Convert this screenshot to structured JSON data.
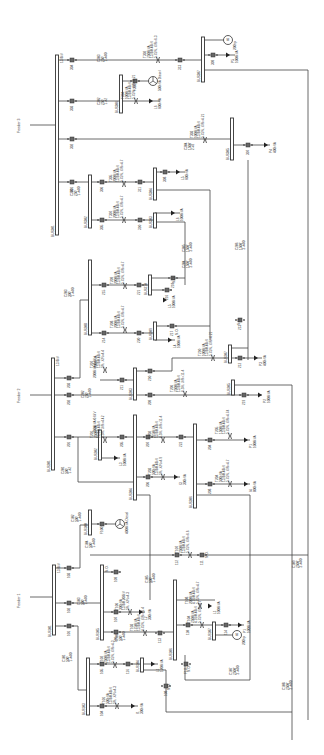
{
  "diagram": {
    "orientation": "rotated -90deg (text reads bottom-to-top)",
    "feeders": [
      {
        "name": "Feeder 3",
        "voltage": "13.8kV",
        "main_bus": "BUS301",
        "label_pos": [
          20,
          125
        ],
        "bus_x": 57,
        "bus_y": [
          55,
          235
        ]
      },
      {
        "name": "Feeder 2",
        "voltage": "13.8kV",
        "main_bus": "BUS201",
        "label_pos": [
          20,
          395
        ],
        "bus_x": 53,
        "bus_y": [
          358,
          470
        ]
      },
      {
        "name": "Feeder 1",
        "voltage": "13.8kV",
        "main_bus": "BUS101",
        "label_pos": [
          20,
          600
        ],
        "bus_x": 54,
        "bus_y": [
          565,
          635
        ]
      }
    ],
    "buses": [
      {
        "id": "BUS307",
        "x": 203,
        "y": [
          37,
          82
        ]
      },
      {
        "id": "BUS306",
        "x": 121,
        "y": [
          75,
          113
        ]
      },
      {
        "id": "BUS305",
        "x": 232,
        "y": [
          118,
          160
        ]
      },
      {
        "id": "BUS302",
        "x": 90,
        "y": [
          175,
          228
        ]
      },
      {
        "id": "BUS304",
        "x": 155,
        "y": [
          168,
          200
        ]
      },
      {
        "id": "BUS303",
        "x": 155,
        "y": [
          213,
          228
        ]
      },
      {
        "id": "BUS208",
        "x": 90,
        "y": [
          260,
          335
        ]
      },
      {
        "id": "BUS210",
        "x": 150,
        "y": [
          275,
          295
        ]
      },
      {
        "id": "BUS209",
        "x": 155,
        "y": [
          322,
          340
        ]
      },
      {
        "id": "BUS207",
        "x": 230,
        "y": [
          345,
          363
        ]
      },
      {
        "id": "BUS203",
        "x": 135,
        "y": [
          368,
          400
        ]
      },
      {
        "id": "BUS202",
        "x": 100,
        "y": [
          430,
          460
        ]
      },
      {
        "id": "BUS205",
        "x": 233,
        "y": [
          380,
          395
        ]
      },
      {
        "id": "BUS204",
        "x": 135,
        "y": [
          415,
          500
        ]
      },
      {
        "id": "BUS206",
        "x": 195,
        "y": [
          424,
          508
        ]
      },
      {
        "id": "BUS100",
        "x": 90,
        "y": [
          510,
          535
        ]
      },
      {
        "id": "BUS105",
        "x": 102,
        "y": [
          565,
          640
        ]
      },
      {
        "id": "BUS106",
        "x": 175,
        "y": [
          580,
          660
        ]
      },
      {
        "id": "BUS107",
        "x": 214,
        "y": [
          622,
          640
        ]
      },
      {
        "id": "BUS103",
        "x": 88,
        "y": [
          658,
          715
        ]
      },
      {
        "id": "BUS104",
        "x": 142,
        "y": [
          658,
          672
        ]
      }
    ],
    "transformers": [
      {
        "id": "T302",
        "rating": "2500kVA",
        "voltage": "13.8/0.48kV",
        "imp": "5.75%, X/R=6.3",
        "x": 158,
        "y": 60
      },
      {
        "id": "T304",
        "rating": "1000kVA",
        "voltage": "13.8/0.48kV",
        "imp": "5.75%, X/R=4.21",
        "x": 136,
        "y": 101
      },
      {
        "id": "T303",
        "rating": "1000kVA",
        "voltage": "13.8/0.48kV",
        "imp": "5.75%, X/R=4.21",
        "x": 205,
        "y": 140
      },
      {
        "id": "T305",
        "rating": "2000kVA",
        "voltage": "13.8/0.48kV",
        "imp": "5.75%, X/R=4.7",
        "x": 124,
        "y": 184
      },
      {
        "id": "T307",
        "rating": "2000kVA",
        "voltage": "13.8/0.48kV",
        "imp": "5.75%, X/R=4.7",
        "x": 124,
        "y": 220
      },
      {
        "id": "T209",
        "rating": "2000kVA",
        "voltage": "13.8/0.48kV",
        "imp": "5.75%, X/R=4.7",
        "x": 125,
        "y": 286
      },
      {
        "id": "T208",
        "rating": "2000kVA",
        "voltage": "13.8/0.48kV",
        "imp": "5.75%, X/R=4.7",
        "x": 125,
        "y": 330
      },
      {
        "id": "T210",
        "rating": "1000kVA",
        "voltage": "13.8/0.48kV",
        "imp": "5.75%, X/R=4.21",
        "x": 213,
        "y": 358
      },
      {
        "id": "T207",
        "rating": "1000kVA",
        "voltage": "13.8/0.48kV",
        "imp": "5%, X/R=4.4",
        "x": 105,
        "y": 370
      },
      {
        "id": "T206",
        "rating": "2500kVA",
        "voltage": "13.8/0.48kV",
        "imp": "6.5%, X/R=11.4",
        "x": 185,
        "y": 394
      },
      {
        "id": "T201",
        "rating": "2500kVA",
        "voltage": "13.8/0.48kV",
        "imp": "6.5%, X/R=4.42",
        "x": 105,
        "y": 440
      },
      {
        "id": "T202",
        "rating": "2750kVA",
        "voltage": "13.8/0.48kV",
        "imp": "6.5%, X/R=11.4",
        "x": 163,
        "y": 440
      },
      {
        "id": "T203",
        "rating": "500kVA",
        "voltage": "13.8/0.48kV",
        "imp": "5%, X/R=4.9",
        "x": 163,
        "y": 477
      },
      {
        "id": "T205",
        "rating": "1500kVA",
        "voltage": "13.8/0.48kV",
        "imp": "5.75%, X/R=4.74",
        "x": 230,
        "y": 436
      },
      {
        "id": "T204",
        "rating": "500kVA",
        "voltage": "13.8/0.48kV",
        "imp": "5.75%, X/R=4.7",
        "x": 230,
        "y": 484
      },
      {
        "id": "T107",
        "rating": "2500kVA",
        "voltage": "13.8/0.48kV",
        "imp": "5.75%, X/R=6.6",
        "x": 190,
        "y": 555
      },
      {
        "id": "T106",
        "rating": "300kVA",
        "voltage": "13.8/0.208kV",
        "imp": "5%, X/R=4.3",
        "x": 130,
        "y": 612
      },
      {
        "id": "T103",
        "rating": "1750kVA",
        "voltage": "13.8/0.48kV",
        "imp": "4.75%, X/R=11.4",
        "x": 145,
        "y": 633
      },
      {
        "id": "T108",
        "rating": "2000kVA",
        "voltage": "4.16/0.48kV",
        "imp": "5.75%, X/R=4.7",
        "x": 200,
        "y": 606
      },
      {
        "id": "T104",
        "rating": "2500kVA",
        "voltage": "4.16/0.48kV",
        "imp": "5.75%, X/R=4.7",
        "x": 202,
        "y": 625
      },
      {
        "id": "T102",
        "rating": "2500kVA",
        "voltage": "13.8/0.48kV",
        "imp": "5.75%, X/R=4.3",
        "x": 115,
        "y": 665
      },
      {
        "id": "T101",
        "rating": "500kVA",
        "voltage": "13.8/0.48kV",
        "imp": "5%, X/R=4.3",
        "x": 117,
        "y": 706
      }
    ],
    "cables": [
      {
        "id": "C303",
        "spec": "250','1-#4/0",
        "x": 100,
        "y": 62
      },
      {
        "id": "C302",
        "spec": "250','1-#2",
        "x": 100,
        "y": 105
      },
      {
        "id": "C304",
        "spec": "1500',2-#2",
        "x": 187,
        "y": 150
      },
      {
        "id": "C301",
        "spec": "250','1-#4/0",
        "x": 73,
        "y": 196
      },
      {
        "id": "C305",
        "spec": "1500','2-#4/0",
        "x": 185,
        "y": 252
      },
      {
        "id": "C204",
        "spec": "1500','2-#4/0",
        "x": 185,
        "y": 268
      },
      {
        "id": "C206",
        "spec": "1500','2-#4/0",
        "x": 238,
        "y": 250
      },
      {
        "id": "C203",
        "spec": "300','1-#4/0",
        "x": 67,
        "y": 297
      },
      {
        "id": "C202",
        "spec": "250','1-#4/0",
        "x": 84,
        "y": 398
      },
      {
        "id": "C201",
        "spec": "500','1-#2",
        "x": 64,
        "y": 474
      },
      {
        "id": "C102",
        "spec": "500','1-#4/0",
        "x": 74,
        "y": 522
      },
      {
        "id": "C104",
        "spec": "500','1-#4/0",
        "x": 88,
        "y": 548
      },
      {
        "id": "C105",
        "spec": "500','1-#4/0",
        "x": 148,
        "y": 583
      },
      {
        "id": "C109",
        "spec": "2500','2-#4/0",
        "x": 295,
        "y": 568
      },
      {
        "id": "C103",
        "spec": "500','1-#4/0",
        "x": 80,
        "y": 605
      },
      {
        "id": "C106",
        "spec": "500','1-#4/0",
        "x": 118,
        "y": 641
      },
      {
        "id": "C101",
        "spec": "500','1-#4/0",
        "x": 65,
        "y": 662
      },
      {
        "id": "C107",
        "spec": "2500','2-#4/0",
        "x": 232,
        "y": 675
      },
      {
        "id": "C108",
        "spec": "2500','2-#4/0",
        "x": 285,
        "y": 690
      }
    ],
    "breakers": [
      {
        "id": "304",
        "x": 72,
        "y": 60
      },
      {
        "id": "313",
        "x": 180,
        "y": 60
      },
      {
        "id": "309",
        "x": 213,
        "y": 55
      },
      {
        "id": "303",
        "x": 72,
        "y": 101
      },
      {
        "id": "F305",
        "x": 135,
        "y": 81
      },
      {
        "id": "302",
        "x": 72,
        "y": 139
      },
      {
        "id": "307",
        "x": 248,
        "y": 145
      },
      {
        "id": "301",
        "x": 72,
        "y": 182
      },
      {
        "id": "306",
        "x": 102,
        "y": 182
      },
      {
        "id": "311",
        "x": 140,
        "y": 182
      },
      {
        "id": "308",
        "x": 165,
        "y": 172
      },
      {
        "id": "305",
        "x": 102,
        "y": 220
      },
      {
        "id": "310",
        "x": 140,
        "y": 220
      },
      {
        "id": "215",
        "x": 104,
        "y": 285
      },
      {
        "id": "221",
        "x": 139,
        "y": 285
      },
      {
        "id": "218",
        "x": 173,
        "y": 278
      },
      {
        "id": "216",
        "x": 167,
        "y": 290
      },
      {
        "id": "214",
        "x": 104,
        "y": 333
      },
      {
        "id": "220",
        "x": 139,
        "y": 333
      },
      {
        "id": "217",
        "x": 172,
        "y": 326
      },
      {
        "id": "213",
        "x": 240,
        "y": 320
      },
      {
        "id": "212",
        "x": 240,
        "y": 358
      },
      {
        "id": "203",
        "x": 69,
        "y": 378
      },
      {
        "id": "211",
        "x": 122,
        "y": 380
      },
      {
        "id": "210",
        "x": 150,
        "y": 371
      },
      {
        "id": "202",
        "x": 69,
        "y": 395
      },
      {
        "id": "209",
        "x": 150,
        "y": 395
      },
      {
        "id": "219",
        "x": 244,
        "y": 395
      },
      {
        "id": "201",
        "x": 69,
        "y": 437
      },
      {
        "id": "205",
        "x": 122,
        "y": 437
      },
      {
        "id": "207",
        "x": 148,
        "y": 437
      },
      {
        "id": "222",
        "x": 181,
        "y": 437
      },
      {
        "id": "204",
        "x": 210,
        "y": 440
      },
      {
        "id": "206",
        "x": 148,
        "y": 477
      },
      {
        "id": "208",
        "x": 210,
        "y": 484
      },
      {
        "id": "F100",
        "x": 102,
        "y": 524
      },
      {
        "id": "112",
        "x": 177,
        "y": 555
      },
      {
        "id": "111",
        "x": 202,
        "y": 555
      },
      {
        "id": "103",
        "x": 69,
        "y": 568
      },
      {
        "id": "109",
        "x": 116,
        "y": 572
      },
      {
        "id": "102",
        "x": 69,
        "y": 603
      },
      {
        "id": "107",
        "x": 116,
        "y": 612
      },
      {
        "id": "101",
        "x": 69,
        "y": 626
      },
      {
        "id": "106",
        "x": 116,
        "y": 632
      },
      {
        "id": "113",
        "x": 160,
        "y": 633
      },
      {
        "id": "110",
        "x": 188,
        "y": 625
      },
      {
        "id": "114",
        "x": 226,
        "y": 625
      },
      {
        "id": "F111",
        "x": 186,
        "y": 664
      },
      {
        "id": "105",
        "x": 102,
        "y": 664
      },
      {
        "id": "116",
        "x": 128,
        "y": 664
      },
      {
        "id": "108",
        "x": 166,
        "y": 686
      },
      {
        "id": "104",
        "x": 102,
        "y": 706
      }
    ],
    "loads": [
      {
        "id": "P5",
        "rating": "1000kVA",
        "x": 230,
        "y": 55
      },
      {
        "id": "L6",
        "rating": "600kVA",
        "x": 153,
        "y": 101
      },
      {
        "id": "P4",
        "rating": "400kVA",
        "x": 268,
        "y": 145
      },
      {
        "id": "L5",
        "rating": "600kVA",
        "x": 180,
        "y": 172
      },
      {
        "id": "L6b",
        "rating": "1000kVA",
        "x": 175,
        "y": 213
      },
      {
        "id": "L5b",
        "rating": "1000kVA",
        "x": 167,
        "y": 300
      },
      {
        "id": "L4",
        "rating": "1000kVA",
        "x": 172,
        "y": 340
      },
      {
        "id": "P3",
        "rating": "400kVA",
        "x": 258,
        "y": 358
      },
      {
        "id": "P2",
        "rating": "1000kVA",
        "x": 262,
        "y": 395
      },
      {
        "id": "L3",
        "rating": "1000kVA",
        "x": 118,
        "y": 458
      },
      {
        "id": "P1b",
        "rating": "1000kVA",
        "x": 248,
        "y": 440
      },
      {
        "id": "I3",
        "rating": "300kVA",
        "x": 178,
        "y": 477
      },
      {
        "id": "I4",
        "rating": "800kVA",
        "x": 248,
        "y": 484
      },
      {
        "id": "L2",
        "rating": "300kVA",
        "x": 143,
        "y": 612
      },
      {
        "id": "L1b",
        "rating": "1000kVA",
        "x": 212,
        "y": 606
      },
      {
        "id": "P1",
        "rating": "1000kVA",
        "x": 242,
        "y": 625
      },
      {
        "id": "L1",
        "rating": "1200kVA",
        "x": 155,
        "y": 664
      },
      {
        "id": "I1",
        "rating": "300kVA",
        "x": 135,
        "y": 706
      }
    ],
    "sources": [
      {
        "id": "M",
        "type": "motor",
        "rating": "200hp",
        "x": 228,
        "y": 40
      },
      {
        "id": "G305",
        "type": "generator",
        "rating": "500kVA Diesel",
        "x": 153,
        "y": 81
      },
      {
        "id": "G100",
        "type": "generator",
        "rating": "4000kVA Diesel",
        "x": 120,
        "y": 524
      },
      {
        "id": "M107",
        "type": "motor",
        "rating": "200hp",
        "x": 237,
        "y": 635
      }
    ],
    "annotations": [
      {
        "text": "N.O.",
        "x": 178,
        "y": 335
      },
      {
        "text": "N.O.",
        "x": 175,
        "y": 283
      },
      {
        "text": "N.O.",
        "x": 240,
        "y": 325
      },
      {
        "text": "N.O.",
        "x": 208,
        "y": 558
      },
      {
        "text": "N.O.",
        "x": 108,
        "y": 572
      },
      {
        "text": "N.O.",
        "x": 190,
        "y": 672
      },
      {
        "text": "N.O.",
        "x": 170,
        "y": 690
      },
      {
        "text": "2000kVA 0.6kV",
        "x": 96,
        "y": 378
      },
      {
        "text": "2500kVA 0.6kV",
        "x": 96,
        "y": 433
      }
    ]
  }
}
